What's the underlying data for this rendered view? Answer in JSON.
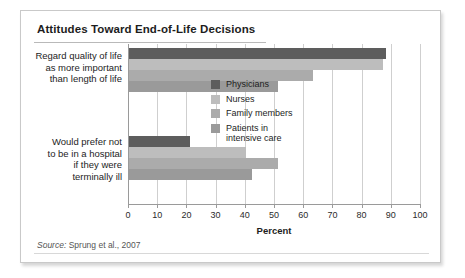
{
  "panel": {
    "title": "Attitudes Toward End-of-Life Decisions",
    "source_prefix": "Source:",
    "source_text": " Sprung et al., 2007"
  },
  "chart_data": {
    "type": "bar",
    "orientation": "horizontal",
    "title": "Attitudes Toward End-of-Life Decisions",
    "xlabel": "Percent",
    "ylabel": "",
    "xlim": [
      0,
      100
    ],
    "xticks": [
      0,
      10,
      20,
      30,
      40,
      50,
      60,
      70,
      80,
      90,
      100
    ],
    "grid": true,
    "legend_position": "inside-right",
    "categories": [
      "Regard quality of life\nas more important\nthan length of life",
      "Would prefer not\nto be in a hospital\nif they were\nterminally ill"
    ],
    "series": [
      {
        "name": "Physicians",
        "color": "#5d5d5d",
        "values": [
          88,
          21
        ]
      },
      {
        "name": "Nurses",
        "color": "#bdbdbd",
        "values": [
          87,
          40
        ]
      },
      {
        "name": "Family members",
        "color": "#ababab",
        "values": [
          63,
          51
        ]
      },
      {
        "name": "Patients in\nintensive care",
        "color": "#9a9a9a",
        "values": [
          51,
          42
        ]
      }
    ]
  },
  "colors": {
    "axis": "#9a9a9a",
    "grid": "#cfcfcf",
    "text": "#1d1d1d",
    "panel_border": "#c9c9c9"
  }
}
